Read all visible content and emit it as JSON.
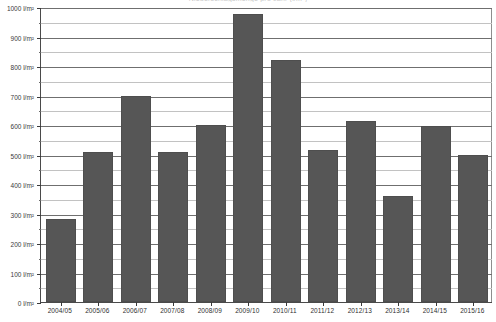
{
  "chart_data": {
    "type": "bar",
    "title": "Niederschlagsmenge pro Jahr (l/m²)",
    "xlabel": "",
    "ylabel": "l/m²",
    "categories": [
      "2004/05",
      "2005/06",
      "2006/07",
      "2007/08",
      "2008/09",
      "2009/10",
      "2010/11",
      "2011/12",
      "2012/13",
      "2013/14",
      "2014/15",
      "2015/16"
    ],
    "values": [
      280,
      510,
      700,
      508,
      600,
      975,
      820,
      515,
      615,
      360,
      595,
      500
    ],
    "ylim": [
      0,
      1000
    ],
    "y_major_ticks": [
      0,
      100,
      200,
      300,
      400,
      500,
      600,
      700,
      800,
      900,
      1000
    ],
    "y_minor_ticks": [
      50,
      150,
      250,
      350,
      450,
      550,
      650,
      750,
      850,
      950
    ],
    "y_tick_labels": [
      "0 l/m²",
      "100 l/m²",
      "200 l/m²",
      "300 l/m²",
      "400 l/m²",
      "500 l/m²",
      "600 l/m²",
      "700 l/m²",
      "800 l/m²",
      "900 l/m²",
      "1000 l/m²"
    ],
    "grid": true,
    "legend": false,
    "bar_color": "#565656",
    "grid_color": "#6f6f6f",
    "minor_grid_color": "#c2c2c2",
    "axis_color": "#4a4a4a"
  }
}
